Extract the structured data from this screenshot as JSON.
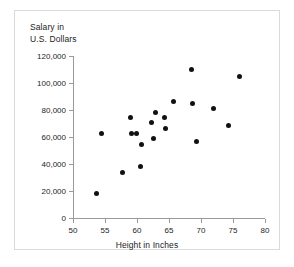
{
  "chart_data": {
    "type": "scatter",
    "title": "",
    "xlabel": "Height in Inches",
    "ylabel": "Salary in U.S. Dollars",
    "ylabel_line1": "Salary in",
    "ylabel_line2": "U.S. Dollars",
    "xlim": [
      50,
      80
    ],
    "ylim": [
      0,
      120000
    ],
    "xticks": [
      50,
      55,
      60,
      65,
      70,
      75,
      80
    ],
    "xtick_labels": [
      "50",
      "55",
      "60",
      "65",
      "70",
      "75",
      "80"
    ],
    "yticks": [
      0,
      20000,
      40000,
      60000,
      80000,
      100000,
      120000
    ],
    "ytick_labels": [
      "0",
      "20,000",
      "40,000",
      "60,000",
      "80,000",
      "100,000",
      "120,000"
    ],
    "grid": false,
    "legend": false,
    "marker_color": "#111111",
    "axis_color": "#9a9a9a",
    "points": [
      {
        "x": 53.7,
        "y": 18500
      },
      {
        "x": 54.5,
        "y": 62500
      },
      {
        "x": 57.7,
        "y": 34000
      },
      {
        "x": 59.0,
        "y": 74500
      },
      {
        "x": 59.1,
        "y": 62500
      },
      {
        "x": 59.9,
        "y": 62500
      },
      {
        "x": 60.5,
        "y": 38500
      },
      {
        "x": 60.7,
        "y": 54500
      },
      {
        "x": 62.3,
        "y": 71000
      },
      {
        "x": 62.6,
        "y": 59000
      },
      {
        "x": 62.9,
        "y": 78500
      },
      {
        "x": 64.3,
        "y": 74500
      },
      {
        "x": 64.5,
        "y": 66000
      },
      {
        "x": 65.7,
        "y": 86500
      },
      {
        "x": 68.5,
        "y": 110000
      },
      {
        "x": 68.6,
        "y": 85000
      },
      {
        "x": 69.3,
        "y": 56500
      },
      {
        "x": 72.0,
        "y": 81000
      },
      {
        "x": 74.3,
        "y": 68500
      },
      {
        "x": 76.0,
        "y": 105000
      }
    ]
  }
}
